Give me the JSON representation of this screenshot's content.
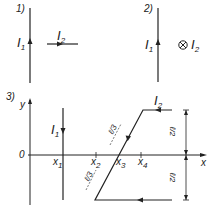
{
  "panels": [
    {
      "label": "1)",
      "wire1": {
        "name": "I",
        "sub": "1",
        "direction": "up"
      },
      "wire2": {
        "name": "I",
        "sub": "2",
        "direction": "right",
        "orientation": "horizontal segment"
      }
    },
    {
      "label": "2)",
      "wire1": {
        "name": "I",
        "sub": "1",
        "direction": "up"
      },
      "wire2": {
        "name": "I",
        "sub": "2",
        "direction": "into page",
        "symbol": "⊗"
      }
    },
    {
      "label": "3)",
      "axes": {
        "x_label": "x",
        "y_label": "y",
        "origin_label": "0"
      },
      "ticks": [
        {
          "name": "x",
          "sub": "1"
        },
        {
          "name": "x",
          "sub": "2"
        },
        {
          "name": "x",
          "sub": "3"
        },
        {
          "name": "x",
          "sub": "4"
        }
      ],
      "wire1": {
        "name": "I",
        "sub": "1",
        "direction": "down"
      },
      "wire2": {
        "name": "I",
        "sub": "2",
        "shape": "bent conductor: top segment leftward, slanted segment, bottom segment leftward"
      },
      "segment_labels": {
        "slant_upper": "ℓ/3",
        "slant_lower": "ℓ/3",
        "dim_upper": "ℓ/2",
        "dim_lower": "ℓ/2"
      }
    }
  ],
  "colors": {
    "ink": "#222222",
    "background": "#ffffff"
  }
}
